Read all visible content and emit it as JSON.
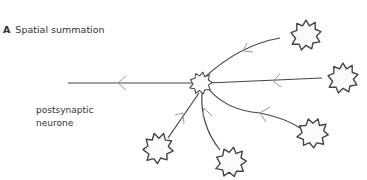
{
  "figure": {
    "panel_letter": "A",
    "title": "Spatial summation",
    "label_line1": "postsynaptic",
    "label_line2": "neurone"
  },
  "colors": {
    "line": "#444444",
    "arrow": "#999999",
    "text": "#333333"
  }
}
